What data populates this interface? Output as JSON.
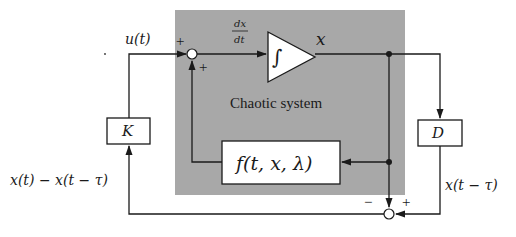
{
  "diagram": {
    "system_label": "Chaotic system",
    "input_label": "u(t)",
    "derivative_num": "dx",
    "derivative_den": "dt",
    "integrator_symbol": "∫",
    "state_label": "x",
    "nonlinear_block": "f(t, x, λ)",
    "gain_block": "K",
    "delay_block": "D",
    "difference_label": "x(t) − x(t − τ)",
    "delayed_label": "x(t − τ)",
    "sum_top_signs": [
      "+",
      "+"
    ],
    "sum_bottom_signs": [
      "−",
      "+"
    ],
    "colors": {
      "system_bg": "#a8a8a8",
      "line": "#1a1a1a",
      "block_fill": "#ffffff"
    }
  }
}
